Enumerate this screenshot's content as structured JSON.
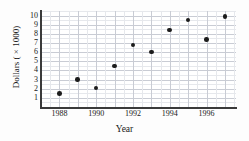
{
  "chart_data": {
    "type": "scatter",
    "title": "",
    "xlabel": "Year",
    "ylabel": "Dollars ( × 1000)",
    "x": [
      1988,
      1989,
      1990,
      1991,
      1992,
      1993,
      1994,
      1995,
      1996,
      1997
    ],
    "values": [
      1.5,
      3.0,
      2.1,
      4.5,
      6.8,
      6.0,
      8.4,
      9.5,
      7.4,
      9.9
    ],
    "points": [
      {
        "x": 1988,
        "y": 1.5
      },
      {
        "x": 1989,
        "y": 3.0
      },
      {
        "x": 1990,
        "y": 2.1
      },
      {
        "x": 1991,
        "y": 4.5
      },
      {
        "x": 1992,
        "y": 6.8
      },
      {
        "x": 1993,
        "y": 6.0
      },
      {
        "x": 1994,
        "y": 8.4
      },
      {
        "x": 1995,
        "y": 9.5
      },
      {
        "x": 1996,
        "y": 7.4
      },
      {
        "x": 1997,
        "y": 9.9
      }
    ],
    "xlim": [
      1987,
      1997.6
    ],
    "ylim": [
      0,
      10.5
    ],
    "xticks": [
      1988,
      1990,
      1992,
      1994,
      1996
    ],
    "xtick_labels": [
      "1988",
      "1990",
      "1992",
      "1994",
      "1996"
    ],
    "yticks": [
      1,
      2,
      3,
      4,
      5,
      6,
      7,
      8,
      9,
      10
    ],
    "ytick_labels": [
      "1",
      "2",
      "3",
      "4",
      "5",
      "6",
      "7",
      "8",
      "9",
      "10"
    ],
    "grid": true,
    "grid_minor": true,
    "legend": null,
    "marker": "filled-circle",
    "marker_color": "#1c1c1c",
    "grid_color": "#c9ccd4",
    "grid_minor_color": "#e6e8ec",
    "axis_color": "#3a3a3a",
    "background": "#ffffff"
  },
  "figure": {
    "plot_area": {
      "left": 41,
      "top": 11,
      "width": 195,
      "height": 96
    }
  }
}
